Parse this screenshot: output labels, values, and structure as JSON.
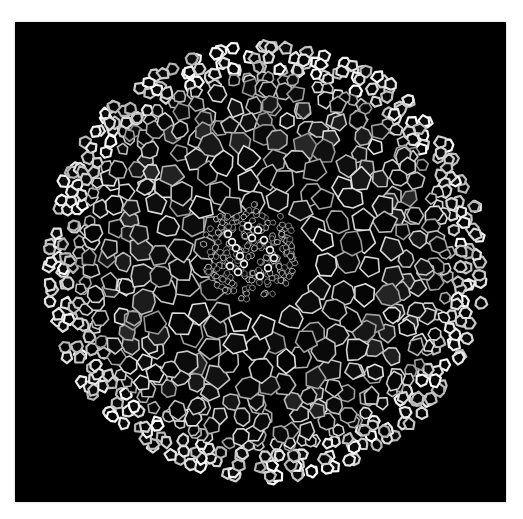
{
  "image": {
    "subject": "plant root cross-section micrograph",
    "description": "Circular cross-section of a plant root showing many polygonal parenchyma cells with bright cell walls on a black background and a dense vascular cylinder near the center.",
    "colors": {
      "page_background": "#ffffff",
      "frame_background": "#000000",
      "cell_wall": "#e6e6e6",
      "cell_interior": "#050505",
      "vascular_highlight": "#f2f2f2"
    },
    "layout": {
      "frame": {
        "x": 15,
        "y": 22,
        "width": 491,
        "height": 480
      },
      "specimen_center": {
        "x": 250,
        "y": 240
      },
      "specimen_radius": 215,
      "vascular_center": {
        "x": 235,
        "y": 230
      },
      "vascular_radius": 48
    }
  }
}
